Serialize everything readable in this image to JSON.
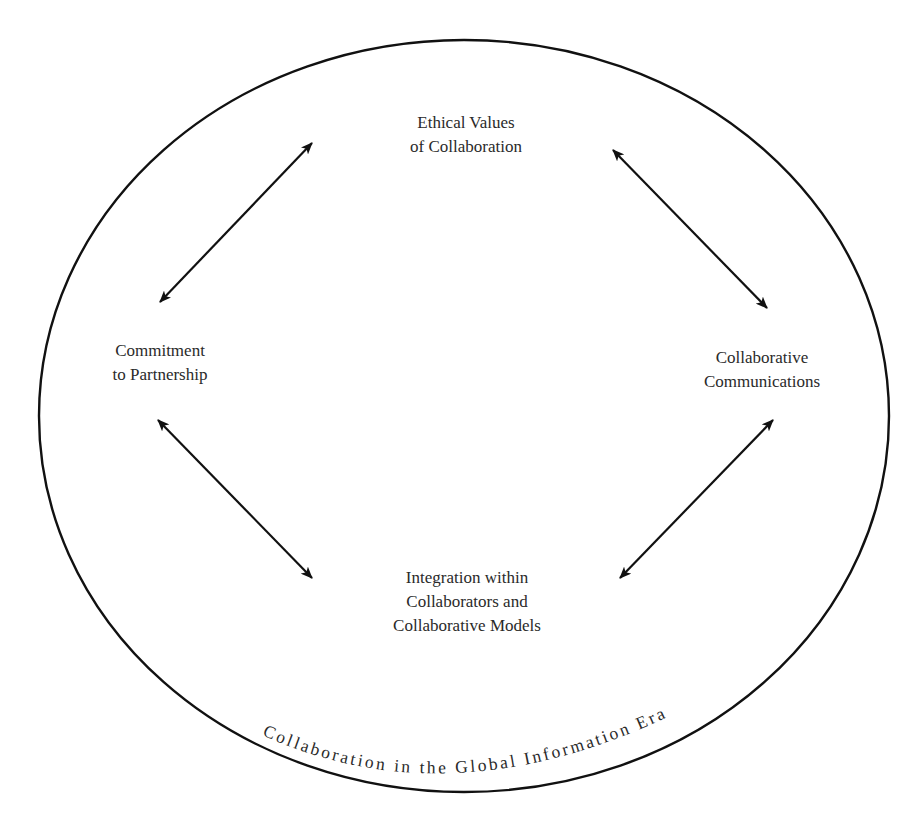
{
  "diagram": {
    "title_curved": "Collaboration in the Global Information Era",
    "colors": {
      "stroke": "#111111",
      "text": "#2a2a2a",
      "background": "#ffffff"
    },
    "ellipse": {
      "cx": 464,
      "cy": 416,
      "rx": 425,
      "ry": 376
    },
    "nodes": {
      "top": {
        "lines": [
          "Ethical Values",
          "of Collaboration"
        ]
      },
      "left": {
        "lines": [
          "Commitment",
          "to Partnership"
        ]
      },
      "right": {
        "lines": [
          "Collaborative",
          "Communications"
        ]
      },
      "bottom": {
        "lines": [
          "Integration within",
          "Collaborators and",
          "Collaborative Models"
        ]
      }
    },
    "arrows": [
      {
        "name": "left-top",
        "from": "Commitment to Partnership",
        "to": "Ethical Values of Collaboration",
        "type": "bidirectional",
        "x1": 160,
        "y1": 302,
        "x2": 312,
        "y2": 143
      },
      {
        "name": "top-right",
        "from": "Ethical Values of Collaboration",
        "to": "Collaborative Communications",
        "type": "bidirectional",
        "x1": 613,
        "y1": 150,
        "x2": 767,
        "y2": 308
      },
      {
        "name": "left-bottom",
        "from": "Commitment to Partnership",
        "to": "Integration within Collaborators and Collaborative Models",
        "type": "bidirectional",
        "x1": 158,
        "y1": 420,
        "x2": 312,
        "y2": 578
      },
      {
        "name": "bottom-right",
        "from": "Integration within Collaborators and Collaborative Models",
        "to": "Collaborative Communications",
        "type": "bidirectional",
        "x1": 620,
        "y1": 578,
        "x2": 773,
        "y2": 420
      }
    ]
  }
}
